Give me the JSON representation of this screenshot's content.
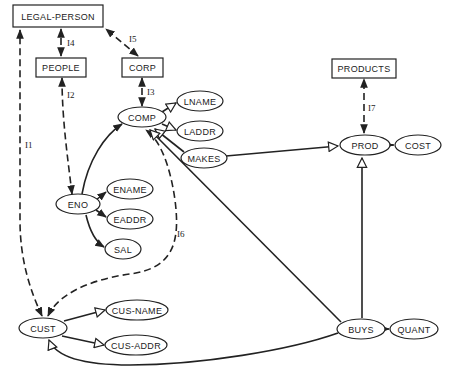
{
  "diagram": {
    "type": "semantic data model / entity-attribute graph",
    "classes": [
      {
        "id": "legal_person",
        "label": "LEGAL-PERSON"
      },
      {
        "id": "people",
        "label": "PEOPLE"
      },
      {
        "id": "corp",
        "label": "CORP"
      },
      {
        "id": "products",
        "label": "PRODUCTS"
      }
    ],
    "entities": [
      {
        "id": "comp",
        "label": "COMP"
      },
      {
        "id": "eno",
        "label": "ENO"
      },
      {
        "id": "cust",
        "label": "CUST"
      },
      {
        "id": "prod",
        "label": "PROD"
      },
      {
        "id": "makes",
        "label": "MAKES"
      },
      {
        "id": "buys",
        "label": "BUYS"
      }
    ],
    "attributes": [
      {
        "id": "lname",
        "label": "LNAME"
      },
      {
        "id": "laddr",
        "label": "LADDR"
      },
      {
        "id": "ename",
        "label": "ENAME"
      },
      {
        "id": "eaddr",
        "label": "EADDR"
      },
      {
        "id": "sal",
        "label": "SAL"
      },
      {
        "id": "cus_name",
        "label": "CUS-NAME"
      },
      {
        "id": "cus_addr",
        "label": "CUS-ADDR"
      },
      {
        "id": "cost",
        "label": "COST"
      },
      {
        "id": "quant",
        "label": "QUANT"
      }
    ],
    "isa_links": [
      {
        "label": "I1",
        "from": "CUST",
        "to": "LEGAL-PERSON"
      },
      {
        "label": "I2",
        "from": "ENO",
        "to": "PEOPLE"
      },
      {
        "label": "I3",
        "from": "COMP",
        "to": "CORP"
      },
      {
        "label": "I4",
        "from": "PEOPLE",
        "to": "LEGAL-PERSON"
      },
      {
        "label": "I5",
        "from": "CORP",
        "to": "LEGAL-PERSON"
      },
      {
        "label": "I6",
        "from": "CUST",
        "to": "COMP"
      },
      {
        "label": "I7",
        "from": "PROD",
        "to": "PRODUCTS"
      }
    ],
    "relationships": [
      {
        "from": "COMP",
        "to": "LNAME"
      },
      {
        "from": "COMP",
        "to": "LADDR"
      },
      {
        "from": "ENO",
        "to": "COMP"
      },
      {
        "from": "ENO",
        "to": "ENAME"
      },
      {
        "from": "ENO",
        "to": "EADDR"
      },
      {
        "from": "ENO",
        "to": "SAL"
      },
      {
        "from": "MAKES",
        "to": "COMP"
      },
      {
        "from": "MAKES",
        "to": "PROD"
      },
      {
        "from": "PROD",
        "to": "COST"
      },
      {
        "from": "BUYS",
        "to": "COMP"
      },
      {
        "from": "BUYS",
        "to": "PROD"
      },
      {
        "from": "BUYS",
        "to": "CUST"
      },
      {
        "from": "BUYS",
        "to": "QUANT"
      },
      {
        "from": "CUST",
        "to": "CUS-NAME"
      },
      {
        "from": "CUST",
        "to": "CUS-ADDR"
      }
    ]
  }
}
